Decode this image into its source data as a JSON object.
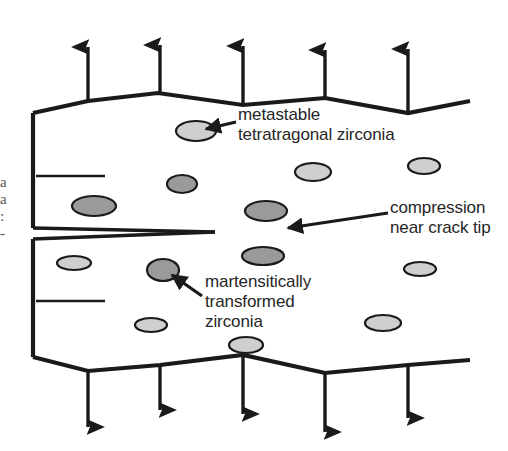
{
  "figure": {
    "background_color": "#ffffff",
    "ink_color": "#1a1a1a",
    "annotations": [
      {
        "id": "metastable",
        "lines": [
          "metastable",
          "tetratragonal zirconia"
        ],
        "text": "metastable\ntetratragonal zirconia",
        "points_to": "light-ellipse-upper"
      },
      {
        "id": "compression",
        "lines": [
          "compression",
          "near crack tip"
        ],
        "text": "compression\nnear crack tip",
        "points_to": "crack-tip"
      },
      {
        "id": "martensitic",
        "lines": [
          "martensitically",
          "transformed",
          "zirconia"
        ],
        "text": "martensitically\ntransformed\nzirconia",
        "points_to": "dark-ellipse-lower"
      }
    ],
    "edge_fragments": {
      "text": "a\na\n:\n-",
      "note": "clipped glyph fragments at the left image border"
    },
    "particles": {
      "metastable_fill": "#cfcfcf",
      "transformed_fill": "#9a9a9a",
      "outline": "#1a1a1a",
      "metastable": [
        {
          "cx": 196,
          "cy": 131,
          "rx": 20,
          "ry": 10
        },
        {
          "cx": 313,
          "cy": 172,
          "rx": 18,
          "ry": 9
        },
        {
          "cx": 424,
          "cy": 166,
          "rx": 16,
          "ry": 8
        },
        {
          "cx": 74,
          "cy": 263,
          "rx": 17,
          "ry": 7
        },
        {
          "cx": 420,
          "cy": 269,
          "rx": 16,
          "ry": 7
        },
        {
          "cx": 151,
          "cy": 325,
          "rx": 16,
          "ry": 7
        },
        {
          "cx": 383,
          "cy": 323,
          "rx": 18,
          "ry": 8
        },
        {
          "cx": 246,
          "cy": 345,
          "rx": 17,
          "ry": 8
        }
      ],
      "transformed": [
        {
          "cx": 182,
          "cy": 184,
          "rx": 15,
          "ry": 9
        },
        {
          "cx": 94,
          "cy": 206,
          "rx": 22,
          "ry": 10
        },
        {
          "cx": 266,
          "cy": 211,
          "rx": 21,
          "ry": 10
        },
        {
          "cx": 163,
          "cy": 270,
          "rx": 16,
          "ry": 11
        },
        {
          "cx": 263,
          "cy": 256,
          "rx": 21,
          "ry": 9
        }
      ]
    },
    "load_arrows": {
      "direction_top": "up",
      "direction_bottom": "down",
      "count_top": 5,
      "count_bottom": 5,
      "top_x": [
        88,
        160,
        243,
        325,
        408
      ],
      "bottom_x": [
        88,
        160,
        243,
        325,
        408
      ]
    },
    "crack": {
      "tip_x": 215,
      "mouth_y_upper": 228,
      "mouth_y_lower": 239,
      "description": "edge crack opening from the left face, tapering to a sharp tip"
    }
  }
}
